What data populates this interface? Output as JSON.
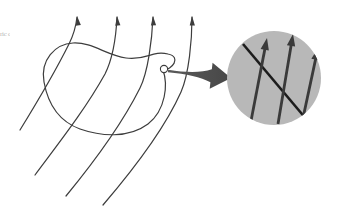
{
  "figure": {
    "background_color": "#ffffff",
    "width": 338,
    "height": 213,
    "margin_note": "ric\nce",
    "colors": {
      "field_line": "#3d3d3d",
      "surface_outline": "#3d3d3d",
      "callout_arrow": "#4e4e4e",
      "inset_fill": "#b8b8b8",
      "inset_arrow": "#3a3a3a",
      "inset_patch_line": "#1c1c1c",
      "marker_outline": "#3d3d3d"
    }
  },
  "field_lines": {
    "label": "electric field lines",
    "count": 4,
    "stroke_width": 1.2,
    "arrowhead_count": 4,
    "paths": [
      "M 20 130 C 36 104, 54 74, 69 44 C 74 34, 76 26, 77 17",
      "M 35 175 C 58 144, 85 110, 105 74 C 112 60, 116 38, 117 17",
      "M 66 196 C 94 162, 122 124, 140 88 C 148 72, 152 40, 153 17",
      "M 103 205 C 133 170, 165 128, 181 92 C 189 74, 192 40, 192 17"
    ],
    "arrowheads": [
      {
        "x": 77,
        "y": 16,
        "angle": -8
      },
      {
        "x": 117,
        "y": 16,
        "angle": -5
      },
      {
        "x": 153,
        "y": 16,
        "angle": -3
      },
      {
        "x": 192,
        "y": 16,
        "angle": -2
      }
    ]
  },
  "closed_surface": {
    "label": "closed gaussian surface",
    "stroke_width": 1.2,
    "path": "M 44 82 C 40 60, 55 44, 73 43 C 92 42, 106 55, 126 58 C 146 61, 152 50, 168 54 C 182 57, 172 70, 163 70 C 168 84, 166 110, 148 124 C 128 139, 100 136, 80 129 C 58 121, 48 104, 44 82 Z"
  },
  "patch_marker": {
    "label": "surface patch point",
    "cx": 164,
    "cy": 69,
    "r": 3.6
  },
  "callout_arrow": {
    "label": "magnification pointer",
    "from_x": 168,
    "from_y": 71,
    "to_x": 231,
    "to_y": 78
  },
  "inset": {
    "label": "magnified view of surface patch",
    "cx": 274,
    "cy": 78,
    "r": 47,
    "fill": "#b8b8b8",
    "patch_line": {
      "label": "surface element",
      "x1": 243,
      "y1": 44,
      "x2": 307,
      "y2": 120,
      "stroke_width": 2.6
    },
    "arrows": [
      {
        "x1": 251,
        "y1": 121,
        "x2": 267,
        "y2": 38
      },
      {
        "x1": 278,
        "y1": 124,
        "x2": 293,
        "y2": 34
      },
      {
        "x1": 303,
        "y1": 118,
        "x2": 318,
        "y2": 48
      }
    ],
    "arrow_stroke_width": 2.8
  }
}
